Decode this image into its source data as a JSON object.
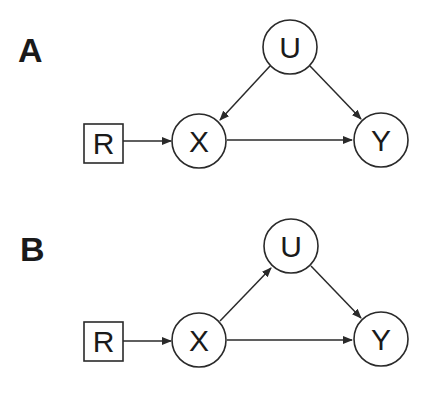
{
  "panels": [
    {
      "label": "A",
      "nodes": {
        "R": {
          "label": "R",
          "shape": "square"
        },
        "X": {
          "label": "X",
          "shape": "circle"
        },
        "U": {
          "label": "U",
          "shape": "circle"
        },
        "Y": {
          "label": "Y",
          "shape": "circle"
        }
      },
      "edges": [
        [
          "R",
          "X"
        ],
        [
          "U",
          "X"
        ],
        [
          "U",
          "Y"
        ],
        [
          "X",
          "Y"
        ]
      ]
    },
    {
      "label": "B",
      "nodes": {
        "R": {
          "label": "R",
          "shape": "square"
        },
        "X": {
          "label": "X",
          "shape": "circle"
        },
        "U": {
          "label": "U",
          "shape": "circle"
        },
        "Y": {
          "label": "Y",
          "shape": "circle"
        }
      },
      "edges": [
        [
          "R",
          "X"
        ],
        [
          "X",
          "U"
        ],
        [
          "U",
          "Y"
        ],
        [
          "X",
          "Y"
        ]
      ]
    }
  ],
  "colors": {
    "stroke": "#2a2a2a",
    "text": "#1a1a1a",
    "background": "#ffffff"
  }
}
